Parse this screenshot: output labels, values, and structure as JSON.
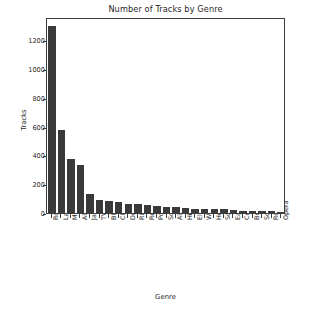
{
  "chart_data": {
    "type": "bar",
    "title": "Number of Tracks by Genre",
    "xlabel": "Genre",
    "ylabel": "Tracks",
    "categories": [
      "Rock",
      "Latin",
      "Metal",
      "Alternative & Punk",
      "Jazz",
      "TV Shows",
      "Blues",
      "Classical",
      "Drama",
      "R&B/Soul",
      "Reggae",
      "Pop",
      "Soundtrack",
      "Alternative",
      "Hip Hop/Rap",
      "Electronica/Dance",
      "World",
      "Heavy Metal",
      "Sci Fi & Fantasy",
      "Easy Listening",
      "Comedy",
      "Bossa Nova",
      "Science Fiction",
      "Rock And Roll",
      "Opera"
    ],
    "values": [
      1297,
      579,
      374,
      332,
      130,
      93,
      81,
      74,
      64,
      61,
      58,
      48,
      43,
      40,
      35,
      30,
      28,
      28,
      26,
      24,
      17,
      15,
      13,
      12,
      1
    ],
    "ylim": [
      0,
      1360
    ],
    "yticks": [
      0,
      200,
      400,
      600,
      800,
      1000,
      1200
    ],
    "ytick_labels": [
      "0",
      "200",
      "400",
      "600",
      "800",
      "1000",
      "1200"
    ],
    "grid": false,
    "legend": false,
    "bar_color": "#3a3a3a",
    "axis_color": "#3d3d3d",
    "text_color": "#1f1f1f",
    "background_color": "#ffffff"
  }
}
